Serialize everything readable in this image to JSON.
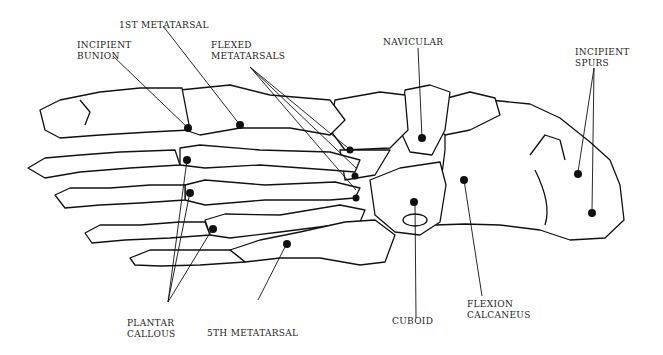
{
  "diagram": {
    "labels": {
      "first_metatarsal": "1ST METATARSAL",
      "incipient_bunion_1": "INCIPIENT",
      "incipient_bunion_2": "BUNION",
      "flexed_metatarsals_1": "FLEXED",
      "flexed_metatarsals_2": "METATARSALS",
      "navicular": "NAVICULAR",
      "incipient_spurs_1": "INCIPIENT",
      "incipient_spurs_2": "SPURS",
      "plantar_callous_1": "PLANTAR",
      "plantar_callous_2": "CALLOUS",
      "fifth_metatarsal": "5TH METATARSAL",
      "cuboid": "CUBOID",
      "flexion_calcaneus_1": "FLEXION",
      "flexion_calcaneus_2": "CALCANEUS"
    },
    "colors": {
      "ink": "#111111",
      "background": "#ffffff"
    }
  }
}
